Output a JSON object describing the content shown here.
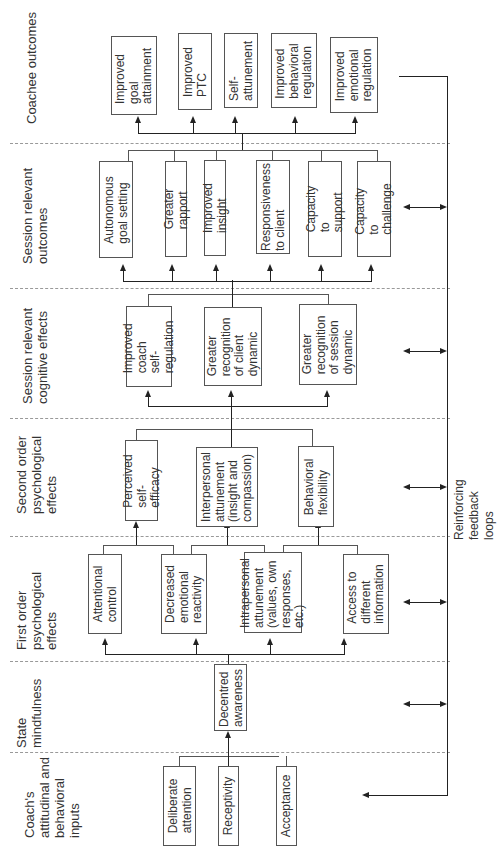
{
  "stages": {
    "s1": "Coach's\nattitudinal and\nbehavioral\ninputs",
    "s2": "State\nmindfulness",
    "s3": "First order\npsychological\neffects",
    "s4": "Second order\npsychological\neffects",
    "s5": "Session relevant\ncognitive effects",
    "s6": "Session relevant\noutcomes",
    "s7": "Coachee outcomes"
  },
  "inputs": [
    "Deliberate\nattention",
    "Receptivity",
    "Acceptance"
  ],
  "state": [
    "Decentred\nawareness"
  ],
  "first_order": [
    "Attentional\ncontrol",
    "Decreased\nemotional\nreactivity",
    "Intrapersonal\nattunement\n(values, own\nresponses, etc.)",
    "Access to\ndifferent\ninformation"
  ],
  "second_order": [
    "Perceived\nself-efficacy",
    "Interpersonal\nattunement\n(insight and\ncompassion)",
    "Behavioral\nflexibility"
  ],
  "cognitive": [
    "Improved\ncoach self-\nregulation",
    "Greater\nrecognition\nof client\ndynamic",
    "Greater\nrecognition\nof session\ndynamic"
  ],
  "session_outcomes": [
    "Autonomous\ngoal setting",
    "Greater rapport",
    "Improved insight",
    "Responsiveness\nto client",
    "Capacity to\nsupport",
    "Capacity to\nchallenge"
  ],
  "coachee_outcomes": [
    "Improved\ngoal\nattainment",
    "Improved\nPTC",
    "Self-\nattunement",
    "Improved\nbehavioral\nregulation",
    "Improved\nemotional\nregulation"
  ],
  "feedback_label": "Reinforcing feedback loops",
  "colors": {
    "line": "#222222",
    "box_border": "#555555",
    "divider": "#999999",
    "text": "#333333"
  }
}
